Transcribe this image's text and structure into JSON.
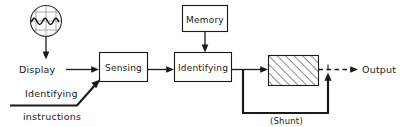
{
  "diagram": {
    "background_color": "#ffffff",
    "line_color": "#1a1a1a",
    "nodes": {
      "crt": {
        "name": "display-crt-icon",
        "label": "",
        "shape": "circle-with-graticule-and-waveform"
      },
      "display": {
        "label": "Display",
        "shape": "text"
      },
      "sensing": {
        "label": "Sensing",
        "shape": "rect"
      },
      "memory": {
        "label": "Memory",
        "shape": "rect"
      },
      "identifying": {
        "label": "Identifying",
        "shape": "rect"
      },
      "hatched": {
        "label": "",
        "shape": "rect-hatched"
      },
      "output": {
        "label": "Output",
        "shape": "text"
      }
    },
    "labels": {
      "identifying_instructions_line1": "Identifying",
      "identifying_instructions_line2": "instructions",
      "shunt": "(Shunt)"
    }
  }
}
